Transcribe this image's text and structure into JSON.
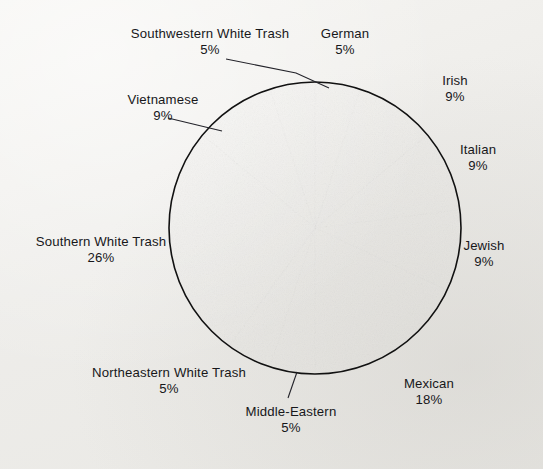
{
  "figure": {
    "background_color": "#f2f1ee",
    "outline_color": "#111111"
  },
  "chart_data": {
    "type": "pie",
    "title": "",
    "subtitle": "",
    "xlabel": "",
    "ylabel": "",
    "legend_position": "none",
    "grid": false,
    "units": "percent",
    "start_angle_deg": 0,
    "direction": "clockwise",
    "center": {
      "x": 315,
      "y": 228
    },
    "radius": 146,
    "categories": [
      "German",
      "Irish",
      "Italian",
      "Jewish",
      "Mexican",
      "Middle-Eastern",
      "Northeastern White Trash",
      "Southern White Trash",
      "Vietnamese",
      "Southwestern White Trash"
    ],
    "values": [
      5,
      9,
      9,
      9,
      18,
      5,
      5,
      26,
      9,
      5
    ],
    "slices": [
      {
        "label": "German",
        "value": 5,
        "percent_text": "5%",
        "color": "#141414",
        "label_position": "top",
        "leader_line": false
      },
      {
        "label": "Irish",
        "value": 9,
        "percent_text": "9%",
        "color": "#c9c9c7",
        "label_position": "top-right",
        "leader_line": false
      },
      {
        "label": "Italian",
        "value": 9,
        "percent_text": "9%",
        "color": "#8d8d8b",
        "label_position": "right",
        "leader_line": false
      },
      {
        "label": "Jewish",
        "value": 9,
        "percent_text": "9%",
        "color": "#3b3b3b",
        "label_position": "right",
        "leader_line": false
      },
      {
        "label": "Mexican",
        "value": 18,
        "percent_text": "18%",
        "color": "#8d8d8b",
        "label_position": "bottom-right",
        "leader_line": false
      },
      {
        "label": "Middle-Eastern",
        "value": 5,
        "percent_text": "5%",
        "color": "#1b1b1b",
        "label_position": "bottom",
        "leader_line": true
      },
      {
        "label": "Northeastern White Trash",
        "value": 5,
        "percent_text": "5%",
        "color": "#c9c9c7",
        "label_position": "bottom-left",
        "leader_line": false
      },
      {
        "label": "Southern White Trash",
        "value": 26,
        "percent_text": "26%",
        "color": "#6f6f6d",
        "label_position": "left",
        "leader_line": false
      },
      {
        "label": "Vietnamese",
        "value": 9,
        "percent_text": "9%",
        "color": "#121212",
        "label_position": "top-left",
        "leader_line": true
      },
      {
        "label": "Southwestern White Trash",
        "value": 5,
        "percent_text": "5%",
        "color": "#c9c9c7",
        "label_position": "top-left",
        "leader_line": true
      }
    ]
  },
  "labels": {
    "southwestern_white_trash": {
      "name": "Southwestern White Trash",
      "percent": "5%"
    },
    "german": {
      "name": "German",
      "percent": "5%"
    },
    "irish": {
      "name": "Irish",
      "percent": "9%"
    },
    "italian": {
      "name": "Italian",
      "percent": "9%"
    },
    "jewish": {
      "name": "Jewish",
      "percent": "9%"
    },
    "mexican": {
      "name": "Mexican",
      "percent": "18%"
    },
    "middle_eastern": {
      "name": "Middle-Eastern",
      "percent": "5%"
    },
    "northeastern_white_trash": {
      "name": "Northeastern White Trash",
      "percent": "5%"
    },
    "southern_white_trash": {
      "name": "Southern White Trash",
      "percent": "26%"
    },
    "vietnamese": {
      "name": "Vietnamese",
      "percent": "9%"
    }
  }
}
